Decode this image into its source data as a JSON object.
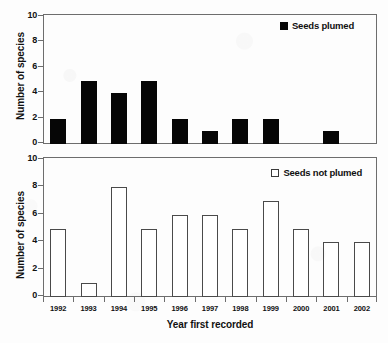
{
  "chart_data": [
    {
      "type": "bar",
      "panel": "top",
      "title": "",
      "categories": [
        "1992",
        "1993",
        "1994",
        "1995",
        "1996",
        "1997",
        "1998",
        "1999",
        "2000",
        "2001",
        "2002"
      ],
      "values": [
        2,
        5,
        4,
        5,
        2,
        1,
        2,
        2,
        0,
        1,
        0
      ],
      "series": [
        {
          "name": "Seeds plumed",
          "values": [
            2,
            5,
            4,
            5,
            2,
            1,
            2,
            2,
            0,
            1,
            0
          ]
        }
      ],
      "legend": "Seeds plumed",
      "legend_position": "top-right",
      "legend_marker": "filled-square",
      "xlabel": "",
      "ylabel": "Number of species",
      "ylim": [
        0,
        10
      ],
      "yticks": [
        0,
        2,
        4,
        6,
        8,
        10
      ],
      "grid": false,
      "bar_color": "#060606"
    },
    {
      "type": "bar",
      "panel": "bottom",
      "title": "",
      "categories": [
        "1992",
        "1993",
        "1994",
        "1995",
        "1996",
        "1997",
        "1998",
        "1999",
        "2000",
        "2001",
        "2002"
      ],
      "values": [
        5,
        1,
        8,
        5,
        6,
        6,
        5,
        7,
        5,
        4,
        4
      ],
      "series": [
        {
          "name": "Seeds not plumed",
          "values": [
            5,
            1,
            8,
            5,
            6,
            6,
            5,
            7,
            5,
            4,
            4
          ]
        }
      ],
      "legend": "Seeds not plumed",
      "legend_position": "top-right",
      "legend_marker": "hollow-square",
      "xlabel": "Year first recorded",
      "ylabel": "Number of species",
      "ylim": [
        0,
        10
      ],
      "yticks": [
        0,
        2,
        4,
        6,
        8,
        10
      ],
      "grid": false,
      "bar_color": "#ffffff",
      "bar_border_color": "#4a4a4a"
    }
  ],
  "axis": {
    "y_ticks": [
      "0",
      "2",
      "4",
      "6",
      "8",
      "10"
    ],
    "y_title": "Number of species",
    "x_ticks": [
      "1992",
      "1993",
      "1994",
      "1995",
      "1996",
      "1997",
      "1998",
      "1999",
      "2000",
      "2001",
      "2002"
    ],
    "x_title": "Year first recorded"
  },
  "legends": {
    "top": "Seeds plumed",
    "bottom": "Seeds not plumed"
  },
  "colors": {
    "bar_filled": "#060606",
    "bar_hollow_fill": "#ffffff",
    "bar_hollow_stroke": "#4a4a4a",
    "frame": "#6d6d6d",
    "background": "#fdfdfd",
    "text": "#111111"
  }
}
